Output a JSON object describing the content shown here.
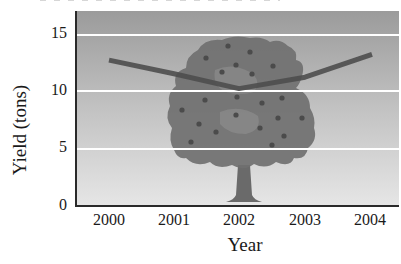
{
  "chart_data": {
    "type": "line",
    "title": "",
    "xlabel": "Year",
    "ylabel": "Yield (tons)",
    "categories": [
      "2000",
      "2001",
      "2002",
      "2003",
      "2004"
    ],
    "series": [
      {
        "name": "Yield",
        "values": [
          12.8,
          11.6,
          10.3,
          11.3,
          13.3
        ]
      }
    ],
    "yticks": [
      "0",
      "5",
      "10",
      "15"
    ],
    "ylim": [
      0,
      17
    ],
    "grid": {
      "horizontal": true,
      "vertical": false,
      "color": "#ffffff"
    },
    "legend": null,
    "annotations": [
      "apple tree illustration in background"
    ]
  },
  "axes": {
    "y_label": "Yield (tons)",
    "x_label": "Year",
    "y_ticks": [
      {
        "label": "15"
      },
      {
        "label": "10"
      },
      {
        "label": "5"
      },
      {
        "label": "0"
      }
    ],
    "x_ticks": [
      {
        "label": "2000"
      },
      {
        "label": "2001"
      },
      {
        "label": "2002"
      },
      {
        "label": "2003"
      },
      {
        "label": "2004"
      }
    ]
  },
  "colors": {
    "plot_top": "#9d9d9d",
    "plot_bottom": "#e4e4e4",
    "line": "#4e4e4e",
    "gridline": "#ffffff",
    "tree_canopy": "#6e6e6e",
    "tree_trunk": "#6a6a6a",
    "fruit": "#4a4a4a"
  }
}
